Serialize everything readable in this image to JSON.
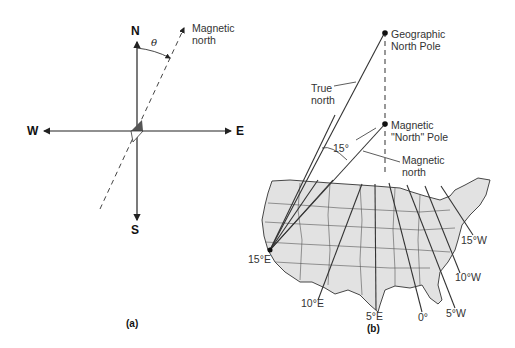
{
  "panel_a": {
    "caption": "(a)",
    "directions": {
      "north": "N",
      "south": "S",
      "east": "E",
      "west": "W"
    },
    "magnetic_north_label": [
      "Magnetic",
      "north"
    ],
    "angle_label": "θ"
  },
  "panel_b": {
    "caption": "(b)",
    "geographic_pole_label": [
      "Geographic",
      "North Pole"
    ],
    "magnetic_pole_label": [
      "Magnetic",
      "\"North\" Pole"
    ],
    "true_north_label": [
      "True",
      "north"
    ],
    "magnetic_north_label": [
      "Magnetic",
      "north"
    ],
    "angle_label": "15°",
    "isogonic_lines": [
      "15°E",
      "10°E",
      "5°E",
      "0°",
      "5°W",
      "10°W",
      "15°W"
    ]
  },
  "colors": {
    "map_fill": "#e2e2e2",
    "line": "#333333",
    "needle_dark": "#555555"
  }
}
